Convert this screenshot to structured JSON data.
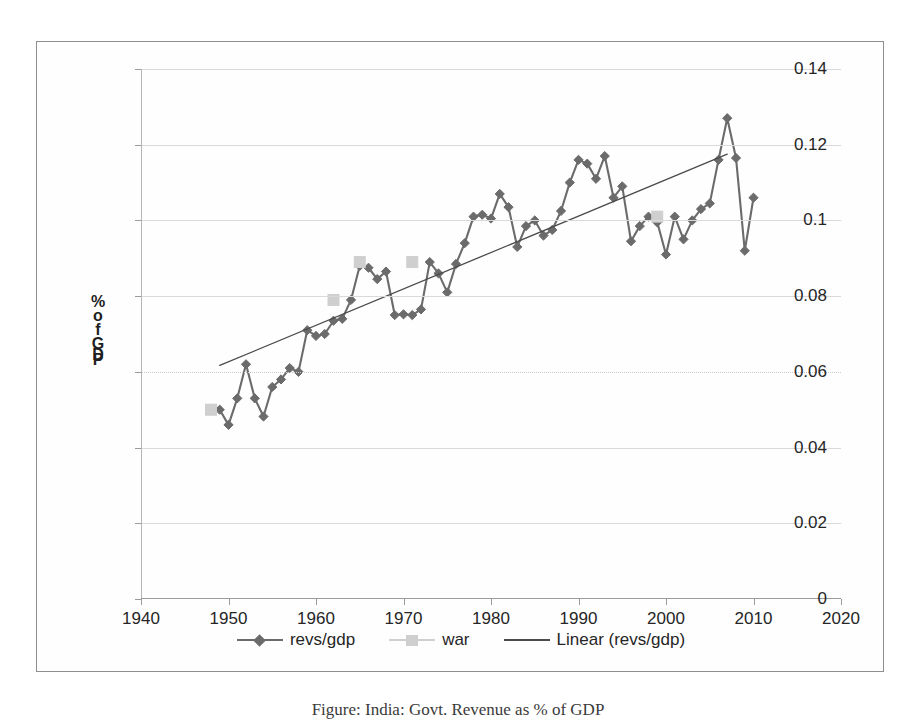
{
  "figure": {
    "caption": "Figure: India: Govt. Revenue as % of GDP"
  },
  "axis_title": {
    "chars": [
      "%",
      "o",
      "f",
      "G",
      "D",
      "P"
    ],
    "text": "% of GDP"
  },
  "legend": {
    "entries": [
      {
        "label": "revs/gdp",
        "marker": "diamond",
        "color": "#6b6b6b",
        "line": true
      },
      {
        "label": "war",
        "marker": "square",
        "color": "#cfcfcf",
        "line": true
      },
      {
        "label": "Linear (revs/gdp)",
        "marker": "none",
        "color": "#4a4a4a",
        "line": true
      }
    ]
  },
  "chart_data": {
    "type": "line",
    "title": "",
    "xlabel": "",
    "ylabel": "% of GDP",
    "xlim": [
      1940,
      2020
    ],
    "ylim": [
      0,
      0.14
    ],
    "xticks": [
      1940,
      1950,
      1960,
      1970,
      1980,
      1990,
      2000,
      2010,
      2020
    ],
    "yticks": [
      0,
      0.02,
      0.04,
      0.06,
      0.08,
      0.1,
      0.12,
      0.14
    ],
    "ytick_labels": [
      "0",
      "0.02",
      "0.04",
      "0.06",
      "0.08",
      "0.1",
      "0.12",
      "0.14"
    ],
    "xtick_labels": [
      "1940",
      "1950",
      "1960",
      "1970",
      "1980",
      "1990",
      "2000",
      "2010",
      "2020"
    ],
    "grid": true,
    "legend_position": "bottom",
    "series": [
      {
        "name": "revs/gdp",
        "type": "line",
        "marker": "diamond",
        "color": "#6b6b6b",
        "x": [
          1949,
          1950,
          1951,
          1952,
          1953,
          1954,
          1955,
          1956,
          1957,
          1958,
          1959,
          1960,
          1961,
          1962,
          1963,
          1964,
          1965,
          1966,
          1967,
          1968,
          1969,
          1970,
          1971,
          1972,
          1973,
          1974,
          1975,
          1976,
          1977,
          1978,
          1979,
          1980,
          1981,
          1982,
          1983,
          1984,
          1985,
          1986,
          1987,
          1988,
          1989,
          1990,
          1991,
          1992,
          1993,
          1994,
          1995,
          1996,
          1997,
          1998,
          1999,
          2000,
          2001,
          2002,
          2003,
          2004,
          2005,
          2006,
          2007,
          2008,
          2009,
          2010
        ],
        "y": [
          0.05,
          0.046,
          0.053,
          0.062,
          0.053,
          0.0482,
          0.056,
          0.058,
          0.061,
          0.06,
          0.071,
          0.0695,
          0.07,
          0.0735,
          0.074,
          0.079,
          0.088,
          0.0875,
          0.0845,
          0.0865,
          0.075,
          0.0752,
          0.075,
          0.0765,
          0.089,
          0.086,
          0.081,
          0.0885,
          0.094,
          0.101,
          0.1015,
          0.1005,
          0.107,
          0.1035,
          0.093,
          0.0985,
          0.1,
          0.096,
          0.0975,
          0.1025,
          0.11,
          0.116,
          0.115,
          0.111,
          0.117,
          0.106,
          0.109,
          0.0945,
          0.0985,
          0.101,
          0.0995,
          0.091,
          0.101,
          0.095,
          0.1,
          0.103,
          0.1045,
          0.116,
          0.127,
          0.1165,
          0.092,
          0.106
        ]
      },
      {
        "name": "war",
        "type": "scatter",
        "marker": "square",
        "color": "#cfcfcf",
        "x": [
          1948,
          1962,
          1965,
          1971,
          1999
        ],
        "y": [
          0.05,
          0.079,
          0.089,
          0.089,
          0.101
        ]
      },
      {
        "name": "Linear (revs/gdp)",
        "type": "line",
        "marker": "none",
        "color": "#4a4a4a",
        "x": [
          1949,
          2007
        ],
        "y": [
          0.0617,
          0.1175
        ]
      }
    ]
  }
}
